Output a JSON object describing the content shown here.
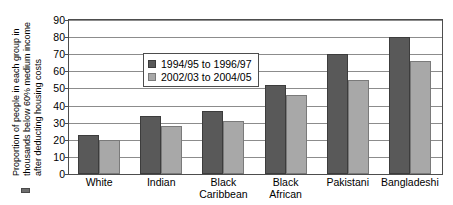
{
  "chart_data": {
    "type": "bar",
    "title": "",
    "xlabel": "",
    "ylabel": "Proportion of people in each group in thousands below 60% medium income after deducting housing costs",
    "ylabel_lines": [
      "Proportion of people in each group in",
      "thousands below 60% medium income",
      "after deducting housing costs"
    ],
    "categories": [
      "White",
      "Indian",
      "Black Caribbean",
      "Black African",
      "Pakistani",
      "Bangladeshi"
    ],
    "category_lines": [
      [
        "White"
      ],
      [
        "Indian"
      ],
      [
        "Black",
        "Caribbean"
      ],
      [
        "Black",
        "African"
      ],
      [
        "Pakistani"
      ],
      [
        "Bangladeshi"
      ]
    ],
    "series": [
      {
        "name": "1994/95 to 1996/97",
        "color": "#595959",
        "values": [
          23,
          34,
          37,
          52,
          70,
          80
        ]
      },
      {
        "name": "2002/03 to 2004/05",
        "color": "#a8a8a8",
        "values": [
          20,
          28,
          31,
          46,
          55,
          66
        ]
      }
    ],
    "ylim": [
      0,
      90
    ],
    "ytick_step": 10,
    "yticks": [
      0,
      10,
      20,
      30,
      40,
      50,
      60,
      70,
      80,
      90
    ],
    "ytick_labels": [
      "0",
      "10",
      "20",
      "30",
      "40",
      "50",
      "60",
      "70",
      "80",
      "90"
    ],
    "grid": true,
    "grid_axis": "y",
    "legend_position": "upper-left-inside"
  },
  "legend": {
    "items": [
      {
        "label": "1994/95 to 1996/97",
        "swatch": "dark-gray-swatch"
      },
      {
        "label": "2002/03 to 2004/05",
        "swatch": "light-gray-swatch"
      }
    ]
  },
  "colors": {
    "series_1": "#595959",
    "series_2": "#a8a8a8",
    "axis": "#4d4d4d",
    "gridline": "#8c8c8c",
    "background": "#ffffff",
    "text": "#000000"
  }
}
